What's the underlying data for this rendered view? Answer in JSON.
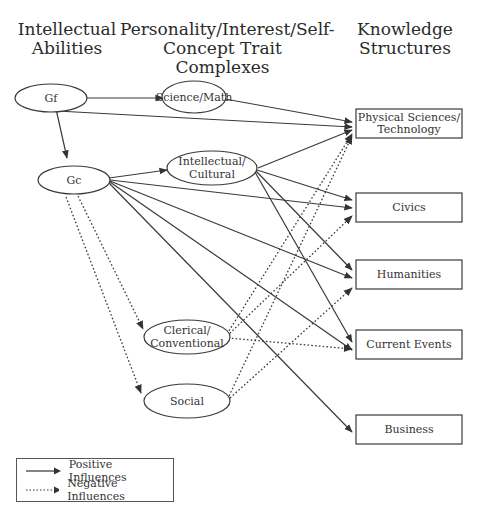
{
  "headers": {
    "abilities": [
      "Intellectual",
      "Abilities"
    ],
    "traits": [
      "Personality/Interest/Self-",
      "Concept Trait Complexes"
    ],
    "knowledge": [
      "Knowledge",
      "Structures"
    ]
  },
  "nodes": {
    "gf": {
      "label": "Gf"
    },
    "gc": {
      "label": "Gc"
    },
    "science_math": {
      "label": "Science/Math"
    },
    "intellectual_cultural": {
      "label": [
        "Intellectual/",
        "Cultural"
      ]
    },
    "clerical_conventional": {
      "label": [
        "Clerical/",
        "Conventional"
      ]
    },
    "social": {
      "label": "Social"
    }
  },
  "boxes": {
    "physical_sciences": {
      "label": [
        "Physical Sciences/",
        "Technology"
      ]
    },
    "civics": {
      "label": "Civics"
    },
    "humanities": {
      "label": "Humanities"
    },
    "current_events": {
      "label": "Current Events"
    },
    "business": {
      "label": "Business"
    }
  },
  "edges": {
    "positive": [
      [
        "Gf",
        "Science/Math"
      ],
      [
        "Gf",
        "Gc"
      ],
      [
        "Gf",
        "Physical Sciences/Technology"
      ],
      [
        "Science/Math",
        "Physical Sciences/Technology"
      ],
      [
        "Gc",
        "Intellectual/Cultural"
      ],
      [
        "Gc",
        "Civics"
      ],
      [
        "Gc",
        "Humanities"
      ],
      [
        "Gc",
        "Current Events"
      ],
      [
        "Gc",
        "Business"
      ],
      [
        "Intellectual/Cultural",
        "Physical Sciences/Technology"
      ],
      [
        "Intellectual/Cultural",
        "Civics"
      ],
      [
        "Intellectual/Cultural",
        "Humanities"
      ],
      [
        "Intellectual/Cultural",
        "Current Events"
      ]
    ],
    "negative": [
      [
        "Gc",
        "Clerical/Conventional"
      ],
      [
        "Gc",
        "Social"
      ],
      [
        "Clerical/Conventional",
        "Physical Sciences/Technology"
      ],
      [
        "Clerical/Conventional",
        "Civics"
      ],
      [
        "Clerical/Conventional",
        "Current Events"
      ],
      [
        "Social",
        "Physical Sciences/Technology"
      ],
      [
        "Social",
        "Humanities"
      ]
    ]
  },
  "legend": {
    "positive": "Positive Influences",
    "negative": "Negative Influences"
  }
}
